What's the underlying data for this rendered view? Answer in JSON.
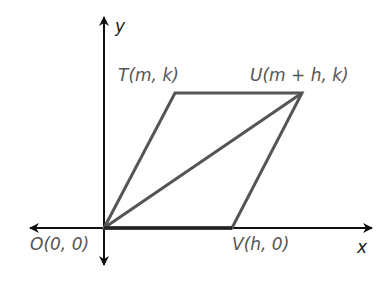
{
  "diagram": {
    "type": "coordinate-geometry",
    "axes": {
      "x_label": "x",
      "y_label": "y"
    },
    "points": [
      {
        "id": "O",
        "label": "O(0, 0)",
        "px": [
          104,
          228
        ]
      },
      {
        "id": "T",
        "label": "T(m, k)",
        "px": [
          175,
          93
        ]
      },
      {
        "id": "U",
        "label": "U(m + h, k)",
        "px": [
          302,
          93
        ]
      },
      {
        "id": "V",
        "label": "V(h, 0)",
        "px": [
          232,
          228
        ]
      }
    ],
    "segments": [
      [
        "O",
        "T"
      ],
      [
        "T",
        "U"
      ],
      [
        "U",
        "V"
      ],
      [
        "V",
        "O"
      ],
      [
        "O",
        "U"
      ]
    ],
    "colors": {
      "shape": "#555555",
      "axis": "#111111",
      "label": "#555555"
    }
  }
}
